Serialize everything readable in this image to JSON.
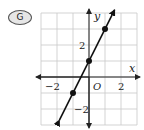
{
  "choice_label": "G",
  "chart_data": {
    "type": "line",
    "title": "",
    "xlabel": "x",
    "ylabel": "y",
    "origin_label": "O",
    "xlim": [
      -3,
      3
    ],
    "ylim": [
      -3,
      4
    ],
    "grid": true,
    "x_ticks_labeled": [
      {
        "value": -2,
        "label": "−2"
      },
      {
        "value": 2,
        "label": "2"
      }
    ],
    "y_ticks_labeled": [
      {
        "value": 2,
        "label": "2"
      },
      {
        "value": -2,
        "label": "−2"
      }
    ],
    "series": [
      {
        "name": "y = 2x + 1",
        "slope": 2,
        "intercept": 1,
        "points": [
          {
            "x": -1,
            "y": -1
          },
          {
            "x": 0,
            "y": 1
          },
          {
            "x": 1,
            "y": 3
          }
        ],
        "arrows_both_ends": true
      }
    ]
  }
}
